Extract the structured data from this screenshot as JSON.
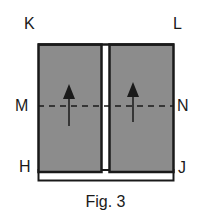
{
  "figure": {
    "caption": "Fig. 3",
    "labels": {
      "top_left": "K",
      "top_right": "L",
      "mid_left": "M",
      "mid_right": "N",
      "bottom_left": "H",
      "bottom_right": "J"
    },
    "colors": {
      "panel_fill": "#8c8c8c",
      "outline": "#1a1a1a",
      "background": "#ffffff"
    },
    "panels": [
      {
        "name": "left-panel",
        "arrow": "up"
      },
      {
        "name": "right-panel",
        "arrow": "up"
      }
    ]
  }
}
